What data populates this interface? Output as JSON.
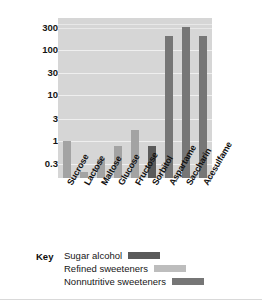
{
  "chart_data": {
    "type": "bar",
    "title": "",
    "xlabel": "",
    "ylabel": "Relative sweetness (sucrose = 1)",
    "yscale": "log",
    "ylim": [
      0.15,
      500
    ],
    "grid": true,
    "legend_position": "bottom",
    "ytick_labels": [
      "300",
      "100",
      "30",
      "10",
      "3",
      "1",
      "0.3"
    ],
    "ytick_values": [
      300,
      100,
      30,
      10,
      3,
      1,
      0.3
    ],
    "categories": [
      "Sucrose",
      "Lactose",
      "Maltose",
      "Glucose",
      "Fructose",
      "Sorbitol",
      "Aspartame",
      "Saccharin",
      "Acesulfame"
    ],
    "values": [
      1.0,
      0.2,
      0.4,
      0.75,
      1.7,
      0.75,
      200,
      320,
      200
    ],
    "groups": [
      "Refined sweeteners",
      "Refined sweeteners",
      "Refined sweeteners",
      "Refined sweeteners",
      "Refined sweeteners",
      "Sugar alcohol",
      "Nonnutritive sweeteners",
      "Nonnutritive sweeteners",
      "Nonnutritive sweeteners"
    ],
    "series": [
      {
        "name": "Refined sweeteners",
        "color": "#a3a3a3",
        "points": [
          {
            "category": "Sucrose",
            "value": 1.0
          },
          {
            "category": "Lactose",
            "value": 0.2
          },
          {
            "category": "Maltose",
            "value": 0.4
          },
          {
            "category": "Glucose",
            "value": 0.75
          },
          {
            "category": "Fructose",
            "value": 1.7
          }
        ]
      },
      {
        "name": "Sugar alcohol",
        "color": "#5a5a5a",
        "points": [
          {
            "category": "Sorbitol",
            "value": 0.75
          }
        ]
      },
      {
        "name": "Nonnutritive sweeteners",
        "color": "#767676",
        "points": [
          {
            "category": "Aspartame",
            "value": 200
          },
          {
            "category": "Saccharin",
            "value": 320
          },
          {
            "category": "Acesulfame",
            "value": 200
          }
        ]
      }
    ],
    "plot_background": "#d6d6d6",
    "gridline_color": "#efefef"
  },
  "axis": {
    "y_title": "Relative sweetness (sucrose = 1)",
    "ticks": [
      {
        "label": "300"
      },
      {
        "label": "100"
      },
      {
        "label": "30"
      },
      {
        "label": "10"
      },
      {
        "label": "3"
      },
      {
        "label": "1"
      },
      {
        "label": "0.3"
      }
    ]
  },
  "x_labels": [
    {
      "label": "Sucrose"
    },
    {
      "label": "Lactose"
    },
    {
      "label": "Maltose"
    },
    {
      "label": "Glucose"
    },
    {
      "label": "Fructose"
    },
    {
      "label": "Sorbitol"
    },
    {
      "label": "Aspartame"
    },
    {
      "label": "Saccharin"
    },
    {
      "label": "Acesulfame"
    }
  ],
  "legend": {
    "title": "Key",
    "entries": [
      {
        "label": "Sugar alcohol",
        "color": "#5a5a5a"
      },
      {
        "label": "Refined sweeteners",
        "color": "#bdbdbd"
      },
      {
        "label": "Nonnutritive sweeteners",
        "color": "#767676"
      }
    ]
  }
}
